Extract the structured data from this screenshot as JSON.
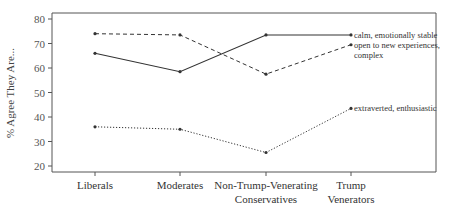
{
  "chart_data": {
    "type": "line",
    "title": "",
    "xlabel": "",
    "ylabel": "% Agree They Are...",
    "ylim": [
      17,
      82
    ],
    "yticks": [
      20,
      30,
      40,
      50,
      60,
      70,
      80
    ],
    "grid": false,
    "legend_position": "inline-right",
    "categories": [
      "Liberals",
      "Moderates",
      "Non-Trump-Venerating Conservatives",
      "Trump Venerators"
    ],
    "category_lines": [
      [
        "Liberals"
      ],
      [
        "Moderates"
      ],
      [
        "Non-Trump-Venerating",
        "Conservatives"
      ],
      [
        "Trump",
        "Venerators"
      ]
    ],
    "series": [
      {
        "name": "calm, emotionally stable",
        "label_lines": [
          "calm, emotionally stable"
        ],
        "style": "solid",
        "values": [
          66,
          58.5,
          73.5,
          73.5
        ]
      },
      {
        "name": "open to new experiences, complex",
        "label_lines": [
          "open to new experiences,",
          "complex"
        ],
        "style": "dashed",
        "values": [
          74,
          73.5,
          57.5,
          69.5
        ]
      },
      {
        "name": "extraverted, enthusiastic",
        "label_lines": [
          "extraverted, enthusiastic"
        ],
        "style": "dotted",
        "values": [
          36,
          35,
          25.5,
          43.5
        ]
      }
    ]
  },
  "colors": {
    "line": "#333333",
    "axis": "#555555"
  }
}
